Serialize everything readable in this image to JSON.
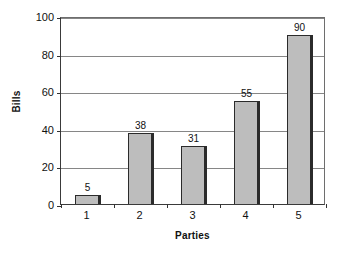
{
  "chart_data": {
    "type": "bar",
    "title": "",
    "subtitle": "",
    "categories": [
      "1",
      "2",
      "3",
      "4",
      "5"
    ],
    "values": [
      5,
      38,
      31,
      55,
      90
    ],
    "data_labels": [
      "5",
      "38",
      "31",
      "55",
      "90"
    ],
    "xlabel": "Parties",
    "ylabel": "Bills",
    "ylim": [
      0,
      100
    ],
    "yticks": [
      0,
      20,
      40,
      60,
      80,
      100
    ],
    "ytick_labels": [
      "0",
      "20",
      "40",
      "60",
      "80",
      "100"
    ],
    "xtick_labels": [
      "1",
      "2",
      "3",
      "4",
      "5"
    ],
    "grid": true,
    "grid_axis": "y",
    "legend": false,
    "legend_position": "none",
    "bar_color": "#bdbdbd",
    "bar_edge_color": "#2b2b2b",
    "gridline_color": "#868686",
    "axis_color": "#3a3a3a",
    "text_color": "#111111",
    "background_color": "#ffffff"
  }
}
